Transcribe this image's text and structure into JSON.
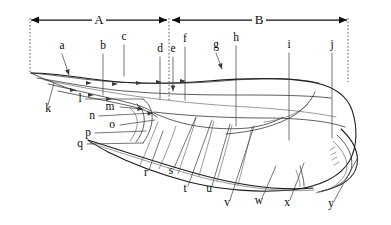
{
  "figure": {
    "background_color": "#ffffff",
    "ink_color": "#1a1a1a",
    "width": 391,
    "height": 225
  },
  "spans": [
    {
      "key": "A",
      "label": "A",
      "label_x": 99,
      "label_y": 24,
      "x1": 31,
      "x2": 167,
      "y": 20,
      "arrow_left": true,
      "arrow_right": true
    },
    {
      "key": "B",
      "label": "B",
      "label_x": 259,
      "label_y": 24,
      "x1": 172,
      "x2": 347,
      "y": 20,
      "arrow_left": true,
      "arrow_right": true
    }
  ],
  "guides": [
    {
      "name": "guide-left",
      "x": 30,
      "y1": 18,
      "y2": 74
    },
    {
      "name": "guide-middle",
      "x": 169,
      "y1": 18,
      "y2": 100
    },
    {
      "name": "guide-right",
      "x": 348,
      "y1": 18,
      "y2": 82
    }
  ],
  "labels": [
    {
      "id": "a",
      "text": "a",
      "x": 62,
      "y": 49,
      "lx": 62,
      "ly": 54,
      "tx": 69,
      "ty": 75,
      "arrow": true
    },
    {
      "id": "b",
      "text": "b",
      "x": 103,
      "y": 49,
      "lx": 103,
      "ly": 54,
      "tx": 103,
      "ty": 95,
      "arrow": false
    },
    {
      "id": "c",
      "text": "c",
      "x": 124,
      "y": 40,
      "lx": 124,
      "ly": 45,
      "tx": 124,
      "ty": 76,
      "arrow": false
    },
    {
      "id": "d",
      "text": "d",
      "x": 160,
      "y": 52,
      "lx": 160,
      "ly": 57,
      "tx": 160,
      "ty": 99,
      "arrow": false
    },
    {
      "id": "e",
      "text": "e",
      "x": 173,
      "y": 52,
      "lx": 173,
      "ly": 57,
      "tx": 173,
      "ty": 91,
      "arrow": true
    },
    {
      "id": "f",
      "text": "f",
      "x": 185,
      "y": 42,
      "lx": 185,
      "ly": 47,
      "tx": 185,
      "ty": 100,
      "arrow": false
    },
    {
      "id": "g",
      "text": "g",
      "x": 216,
      "y": 48,
      "lx": 216,
      "ly": 53,
      "tx": 222,
      "ty": 69,
      "arrow": true
    },
    {
      "id": "h",
      "text": "h",
      "x": 236,
      "y": 41,
      "lx": 236,
      "ly": 46,
      "tx": 236,
      "ty": 126,
      "arrow": false
    },
    {
      "id": "i",
      "text": "i",
      "x": 289,
      "y": 48,
      "lx": 289,
      "ly": 53,
      "tx": 289,
      "ty": 140,
      "arrow": false
    },
    {
      "id": "j",
      "text": "j",
      "x": 332,
      "y": 48,
      "lx": 332,
      "ly": 53,
      "tx": 332,
      "ty": 138,
      "arrow": false
    },
    {
      "id": "k",
      "text": "k",
      "x": 48,
      "y": 112,
      "lx": 48,
      "ly": 105,
      "tx": 54,
      "ty": 83,
      "arrow": false
    },
    {
      "id": "l",
      "text": "l",
      "x": 80,
      "y": 102,
      "lx": 85,
      "ly": 99,
      "tx": 143,
      "ty": 99,
      "arrow": false
    },
    {
      "id": "m",
      "text": "m",
      "x": 110,
      "y": 110,
      "lx": 120,
      "ly": 107,
      "tx": 143,
      "ty": 109,
      "arrow": true
    },
    {
      "id": "n",
      "text": "n",
      "x": 92,
      "y": 119,
      "lx": 99,
      "ly": 116,
      "tx": 153,
      "ty": 113,
      "arrow": true
    },
    {
      "id": "o",
      "text": "o",
      "x": 112,
      "y": 128,
      "lx": 120,
      "ly": 125,
      "tx": 155,
      "ty": 120,
      "arrow": false
    },
    {
      "id": "p",
      "text": "p",
      "x": 88,
      "y": 136,
      "lx": 95,
      "ly": 133,
      "tx": 146,
      "ty": 131,
      "arrow": false
    },
    {
      "id": "q",
      "text": "q",
      "x": 80,
      "y": 147,
      "lx": 87,
      "ly": 144,
      "tx": 143,
      "ty": 143,
      "arrow": false
    },
    {
      "id": "r",
      "text": "r",
      "x": 146,
      "y": 176,
      "lx": 149,
      "ly": 170,
      "tx": 163,
      "ty": 131,
      "arrow": false
    },
    {
      "id": "s",
      "text": "s",
      "x": 171,
      "y": 174,
      "lx": 174,
      "ly": 168,
      "tx": 196,
      "ty": 117,
      "arrow": false
    },
    {
      "id": "t",
      "text": "t",
      "x": 185,
      "y": 192,
      "lx": 188,
      "ly": 186,
      "tx": 212,
      "ty": 120,
      "arrow": false
    },
    {
      "id": "u",
      "text": "u",
      "x": 209,
      "y": 192,
      "lx": 212,
      "ly": 186,
      "tx": 230,
      "ty": 124,
      "arrow": false
    },
    {
      "id": "v",
      "text": "v",
      "x": 227,
      "y": 206,
      "lx": 230,
      "ly": 200,
      "tx": 254,
      "ty": 126,
      "arrow": false
    },
    {
      "id": "w",
      "text": "w",
      "x": 259,
      "y": 204,
      "lx": 262,
      "ly": 198,
      "tx": 276,
      "ty": 166,
      "arrow": false
    },
    {
      "id": "x",
      "text": "x",
      "x": 287,
      "y": 206,
      "lx": 290,
      "ly": 200,
      "tx": 304,
      "ty": 163,
      "arrow": false
    },
    {
      "id": "y",
      "text": "y",
      "x": 331,
      "y": 207,
      "lx": 334,
      "ly": 201,
      "tx": 357,
      "ty": 159,
      "arrow": false
    }
  ],
  "strokes": {
    "body_outer": "M 31,73 C 52,74 78,79 104,82 C 140,86 182,85 218,82 C 254,79 292,79 318,85 C 336,89 348,98 352,112 C 357,130 356,148 349,161 C 340,178 318,187 290,190 C 258,193 222,190 190,182 C 156,173 128,161 110,152 C 98,146 90,142 88,140",
    "dorsal_upper": "M 31,73 C 58,76 86,81 118,83 C 152,85 190,84 224,81 C 258,78 294,77 320,83",
    "dorsal_second": "M 36,78 C 62,82 92,88 124,91 C 160,94 196,95 232,95 C 268,95 304,95 330,97",
    "ventral_fold": "M 47,83 C 70,88 96,94 118,99 C 134,103 144,106 150,110",
    "ventral_lower": "M 60,92 C 84,97 110,102 132,107 C 144,110 152,113 157,117",
    "mid_ridge": "M 152,112 C 186,116 226,118 262,118 C 296,118 326,120 344,126",
    "lower_ridge": "M 88,140 C 120,150 158,163 198,174 C 238,185 280,191 312,188",
    "belly_curve": "M 150,110 C 158,114 168,119 180,122 C 200,127 224,129 246,127 C 262,125 274,122 282,117",
    "tail_arc_1": "M 340,130 C 352,140 358,152 356,164 C 353,178 340,186 322,190",
    "tail_arc_2": "M 336,136 C 348,146 353,158 350,169 C 346,181 334,188 318,191"
  }
}
